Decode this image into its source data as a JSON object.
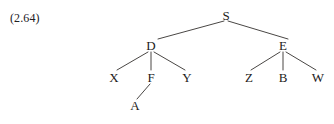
{
  "figure": {
    "example_number": "(2.64)",
    "background_color": "#ffffff",
    "text_color": "#1d1b1a",
    "edge_color": "#4a4745"
  },
  "tree": {
    "nodes": [
      {
        "id": "S",
        "label": "S",
        "x": 226,
        "y": 15
      },
      {
        "id": "D",
        "label": "D",
        "x": 151,
        "y": 45
      },
      {
        "id": "E",
        "label": "E",
        "x": 283,
        "y": 45
      },
      {
        "id": "X",
        "label": "X",
        "x": 114,
        "y": 77
      },
      {
        "id": "F",
        "label": "F",
        "x": 151,
        "y": 77
      },
      {
        "id": "Y",
        "label": "Y",
        "x": 187,
        "y": 77
      },
      {
        "id": "Z",
        "label": "Z",
        "x": 249,
        "y": 77
      },
      {
        "id": "B",
        "label": "B",
        "x": 283,
        "y": 77
      },
      {
        "id": "W",
        "label": "W",
        "x": 318,
        "y": 77
      },
      {
        "id": "A",
        "label": "A",
        "x": 135,
        "y": 105
      }
    ],
    "edges": [
      {
        "from": "S",
        "to": "D",
        "x1": 224,
        "y1": 21,
        "x2": 158,
        "y2": 39
      },
      {
        "from": "S",
        "to": "E",
        "x1": 228,
        "y1": 21,
        "x2": 288,
        "y2": 39
      },
      {
        "from": "D",
        "to": "X",
        "x1": 148,
        "y1": 52,
        "x2": 117,
        "y2": 70
      },
      {
        "from": "D",
        "to": "F",
        "x1": 151,
        "y1": 52,
        "x2": 151,
        "y2": 70
      },
      {
        "from": "D",
        "to": "Y",
        "x1": 154,
        "y1": 52,
        "x2": 185,
        "y2": 70
      },
      {
        "from": "E",
        "to": "Z",
        "x1": 280,
        "y1": 52,
        "x2": 251,
        "y2": 70
      },
      {
        "from": "E",
        "to": "B",
        "x1": 283,
        "y1": 52,
        "x2": 283,
        "y2": 70
      },
      {
        "from": "E",
        "to": "W",
        "x1": 286,
        "y1": 52,
        "x2": 316,
        "y2": 70
      },
      {
        "from": "F",
        "to": "A",
        "x1": 150,
        "y1": 84,
        "x2": 137,
        "y2": 99
      }
    ]
  }
}
